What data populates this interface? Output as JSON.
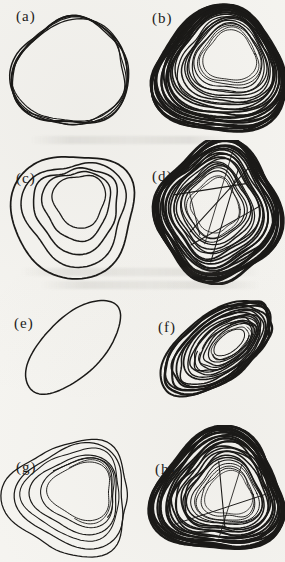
{
  "figure": {
    "kind": "scanned journal figure, eight phase-portrait panels in a 4x2 grid, black ink on paper",
    "ink_color": "#1b1a18",
    "paper_color": "#f6f5f1",
    "panel_labels": [
      "(a)",
      "(b)",
      "(c)",
      "(d)",
      "(e)",
      "(f)",
      "(g)",
      "(h)"
    ]
  },
  "chart_data": {
    "type": "line",
    "title": "",
    "xlabel": "",
    "ylabel": "",
    "axes_shown": false,
    "panels": [
      {
        "label": "(a)",
        "kind": "quasi-periodic thin band (few turns of one loop)",
        "cx": 70,
        "cy": 70,
        "rx": 59,
        "ry": 53,
        "rot": -12,
        "t3": 0.06,
        "p3": 160,
        "t1": 0.05,
        "p1": 90,
        "traces": 5,
        "shrink": 0.96,
        "shrinkPow": 1,
        "driftX": 0,
        "driftY": 0,
        "wOut": 1.5,
        "wIn": 1.1,
        "jitter": 0.035,
        "cJit": 1.8,
        "seed": 11,
        "labelX": 16,
        "labelY": 8
      },
      {
        "label": "(b)",
        "kind": "chaotic attractor, dense triangular band, hole upper-right",
        "cx": 76,
        "cy": 72,
        "rx": 64,
        "ry": 62,
        "rot": -5,
        "t3": 0.1,
        "p3": 120,
        "t1": 0.04,
        "p1": 70,
        "traces": 26,
        "shrink": 0.4,
        "shrinkPow": 1.6,
        "driftX": 12,
        "driftY": -16,
        "wOut": 2.6,
        "wIn": 0.8,
        "jitter": 0.02,
        "cJit": 1.2,
        "seed": 22,
        "labelX": 10,
        "labelY": 10
      },
      {
        "label": "(c)",
        "kind": "periodic orbit, few nested triangular loops",
        "cx": 72,
        "cy": 68,
        "rx": 62,
        "ry": 60,
        "rot": -8,
        "t3": 0.09,
        "p3": 270,
        "t1": 0.06,
        "p1": 90,
        "traces": 5,
        "shrink": 0.42,
        "shrinkPow": 0.85,
        "driftX": 8,
        "driftY": -10,
        "wOut": 1.7,
        "wIn": 1.3,
        "jitter": 0.028,
        "cJit": 1.5,
        "seed": 33,
        "labelX": 16,
        "labelY": 30
      },
      {
        "label": "(d)",
        "kind": "chaotic attractor, dense rounded quadrilateral with interior crossings",
        "cx": 76,
        "cy": 70,
        "rx": 60,
        "ry": 66,
        "rot": 4,
        "t4": 0.07,
        "p4": 25,
        "t3": 0.03,
        "p3": 100,
        "traces": 22,
        "shrink": 0.38,
        "shrinkPow": 1.5,
        "driftX": -4,
        "driftY": -6,
        "wOut": 2.6,
        "wIn": 0.9,
        "jitter": 0.022,
        "cJit": 1.4,
        "seed": 44,
        "chords": 6,
        "labelX": 10,
        "labelY": 28
      },
      {
        "label": "(e)",
        "kind": "single thin limit cycle, tilted ellipse",
        "cx": 73,
        "cy": 62,
        "rx": 60,
        "ry": 29,
        "rot": -44,
        "traces": 1,
        "shrink": 1,
        "shrinkPow": 1,
        "driftX": 0,
        "driftY": 0,
        "wOut": 1.5,
        "wIn": 1.5,
        "jitter": 0.012,
        "cJit": 0,
        "seed": 55,
        "labelX": 14,
        "labelY": 30
      },
      {
        "label": "(f)",
        "kind": "chaotic attractor, dense tilted elliptical band with inner arcs",
        "cx": 74,
        "cy": 64,
        "rx": 64,
        "ry": 33,
        "rot": -38,
        "traces": 16,
        "shrink": 0.28,
        "shrinkPow": 1.25,
        "driftX": 14,
        "driftY": -6,
        "wOut": 2.3,
        "wIn": 0.9,
        "jitter": 0.03,
        "cJit": 1.4,
        "seed": 66,
        "arcs": 6,
        "labelX": 16,
        "labelY": 34
      },
      {
        "label": "(g)",
        "kind": "periodic orbit, thin nested triangular loops with inner arc",
        "cx": 72,
        "cy": 74,
        "rx": 62,
        "ry": 58,
        "rot": 2,
        "t3": 0.12,
        "p3": 180,
        "traces": 6,
        "shrink": 0.5,
        "shrinkPow": 0.9,
        "driftX": 10,
        "driftY": -6,
        "wOut": 1.3,
        "wIn": 1.0,
        "jitter": 0.025,
        "cJit": 1.6,
        "seed": 77,
        "arcs": 2,
        "labelX": 16,
        "labelY": 34
      },
      {
        "label": "(h)",
        "kind": "chaotic attractor, dense triangular band with interior chords",
        "cx": 76,
        "cy": 70,
        "rx": 64,
        "ry": 61,
        "rot": -4,
        "t3": 0.12,
        "p3": 120,
        "traces": 24,
        "shrink": 0.36,
        "shrinkPow": 1.5,
        "driftX": 10,
        "driftY": 2,
        "wOut": 2.6,
        "wIn": 0.9,
        "jitter": 0.028,
        "cJit": 1.4,
        "seed": 88,
        "chords": 3,
        "labelX": 13,
        "labelY": 36
      }
    ]
  }
}
